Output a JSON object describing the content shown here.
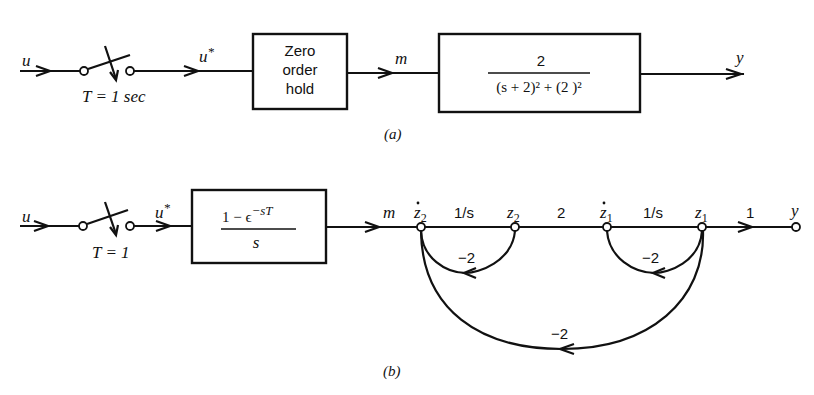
{
  "diagram_a": {
    "caption": "(a)",
    "input_label": "u",
    "sampled_label": "u*",
    "sampled_base": "u",
    "sampled_star": "*",
    "sampler_label": "T = 1  sec",
    "zoh_lines": [
      "Zero",
      "order",
      "hold"
    ],
    "zoh_label": "Zero order hold",
    "hold_output_label": "m",
    "plant_numerator": "2",
    "plant_denominator": "(s + 2)² + (2 )²",
    "output_label": "y"
  },
  "diagram_b": {
    "caption": "(b)",
    "input_label": "u",
    "sampled_base": "u",
    "sampled_star": "*",
    "sampler_label": "T = 1",
    "zoh_numerator": "1 − ϵ",
    "zoh_exponent": "−sT",
    "zoh_denominator": "s",
    "hold_output_label": "m",
    "nodes": [
      {
        "id": "z2dot",
        "label": "ż₂",
        "base": "z",
        "sub": "2",
        "dot": true
      },
      {
        "id": "z2",
        "label": "z₂",
        "base": "z",
        "sub": "2",
        "dot": false
      },
      {
        "id": "z1dot",
        "label": "ż₁",
        "base": "z",
        "sub": "1",
        "dot": true
      },
      {
        "id": "z1",
        "label": "z₁",
        "base": "z",
        "sub": "1",
        "dot": false
      },
      {
        "id": "y",
        "label": "y"
      }
    ],
    "forward_branches": [
      {
        "from": "z2dot",
        "to": "z2",
        "gain": "1/s"
      },
      {
        "from": "z2",
        "to": "z1dot",
        "gain": "2"
      },
      {
        "from": "z1dot",
        "to": "z1",
        "gain": "1/s"
      },
      {
        "from": "z1",
        "to": "y",
        "gain": "1"
      }
    ],
    "feedback_branches": [
      {
        "from": "z2",
        "to": "z2dot",
        "gain": "−2"
      },
      {
        "from": "z1",
        "to": "z1dot",
        "gain": "−2"
      },
      {
        "from": "z1",
        "to": "z2dot",
        "gain": "−2"
      }
    ]
  }
}
